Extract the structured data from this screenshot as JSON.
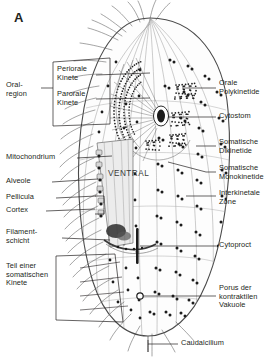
{
  "figure": {
    "panel_letter": "A",
    "orientation_label": "VENTRAL",
    "colors": {
      "ink": "#231f20",
      "outline": "#4a4a4a",
      "kinety_line": "#8a8a8a",
      "cortex_fill": "#e9e9e9",
      "dark_organelle": "#1c1c1c",
      "background": "#ffffff"
    }
  },
  "labels_left": [
    {
      "id": "oral-region",
      "text": "Oral-\nregion"
    },
    {
      "id": "periorale-kinete",
      "text": "Periorale\nKinete"
    },
    {
      "id": "parorale-kinete",
      "text": "Parorale\nKinete"
    },
    {
      "id": "mitochondrium",
      "text": "Mitochondrium"
    },
    {
      "id": "alveole",
      "text": "Alveole"
    },
    {
      "id": "pellicula",
      "text": "Pellicula"
    },
    {
      "id": "cortex",
      "text": "Cortex"
    },
    {
      "id": "filamentschicht",
      "text": "Filament-\nschicht"
    },
    {
      "id": "teil-einer-somatischen-kinete",
      "text": "Teil einer\nsomatischen\nKinete"
    }
  ],
  "labels_right": [
    {
      "id": "orale-polykinetide",
      "text": "Orale\nPolykinetide"
    },
    {
      "id": "cytostom",
      "text": "Cytostom"
    },
    {
      "id": "somatische-dikinetide",
      "text": "Somatische\nDikinetide"
    },
    {
      "id": "somatische-monokinetide",
      "text": "Somatische\nMonokinetide"
    },
    {
      "id": "interkinetale-zone",
      "text": "Interkinetale\nZone"
    },
    {
      "id": "cytoproct",
      "text": "Cytoproct"
    },
    {
      "id": "porus-der-kontraktilen-vakuole",
      "text": "Porus der\nkontraktilen\nVakuole"
    }
  ],
  "labels_bottom": [
    {
      "id": "caudalcilium",
      "text": "Caudalcilium"
    }
  ]
}
